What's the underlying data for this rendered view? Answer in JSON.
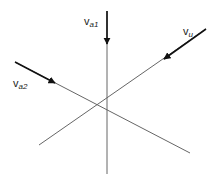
{
  "diagram": {
    "type": "vector-lines",
    "colors": {
      "line": "#555555",
      "arrow": "#111111",
      "background": "#ffffff"
    },
    "vectors": [
      {
        "id": "va1",
        "label_main": "v",
        "label_sub": "a1",
        "direction": "downward"
      },
      {
        "id": "vu",
        "label_main": "v",
        "label_sub": "u",
        "direction": "down-left"
      },
      {
        "id": "va2",
        "label_main": "v",
        "label_sub": "a2",
        "direction": "down-right"
      }
    ]
  }
}
